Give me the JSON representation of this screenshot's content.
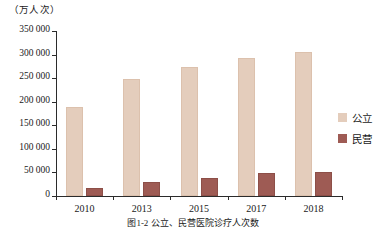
{
  "chart_data": {
    "type": "bar",
    "title": "",
    "caption": "图1-2 公立、民营医院诊疗人次数",
    "unit_label": "（万人次）",
    "xlabel": "",
    "ylabel": "",
    "categories": [
      "2010",
      "2013",
      "2015",
      "2017",
      "2018"
    ],
    "series": [
      {
        "name": "公立",
        "color": "#e4cdbc",
        "values": [
          188000,
          248000,
          273000,
          293000,
          305000
        ]
      },
      {
        "name": "民营",
        "color": "#9e5b54",
        "values": [
          18000,
          30000,
          38000,
          48000,
          52000
        ]
      }
    ],
    "ylim": [
      0,
      350000
    ],
    "yticks": [
      0,
      50000,
      100000,
      150000,
      200000,
      250000,
      300000,
      350000
    ],
    "ytick_labels": [
      "0",
      "50 000",
      "100 000",
      "150 000",
      "200 000",
      "250 000",
      "300 000",
      "350 000"
    ],
    "grid": false,
    "legend_position": "right"
  },
  "legend": {
    "items": [
      {
        "label": "公立",
        "color": "#e4cdbc"
      },
      {
        "label": "民营",
        "color": "#9e5b54"
      }
    ]
  }
}
